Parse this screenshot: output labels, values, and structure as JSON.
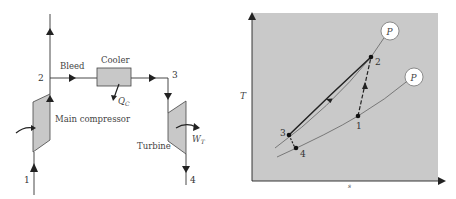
{
  "schematic": {
    "labels": {
      "bleed": "Bleed",
      "cooler": "Cooler",
      "main_compressor": "Main compressor",
      "turbine": "Turbine",
      "heat_out": "Q",
      "heat_out_sub": "C",
      "work_out": "W",
      "work_out_sub": "T"
    },
    "state_points": {
      "p1": "1",
      "p2": "2",
      "p3": "3",
      "p4": "4"
    },
    "colors": {
      "component_fill": "#c8c8c8",
      "line": "#333333"
    }
  },
  "ts_diagram": {
    "axis_labels": {
      "y": "T",
      "x": "s"
    },
    "isobar_labels": {
      "high": "P",
      "low": "P"
    },
    "state_points": {
      "p1": "1",
      "p2": "2",
      "p3": "3",
      "p4": "4"
    },
    "colors": {
      "panel_fill": "#c9c9c9",
      "curve": "#222222"
    }
  }
}
